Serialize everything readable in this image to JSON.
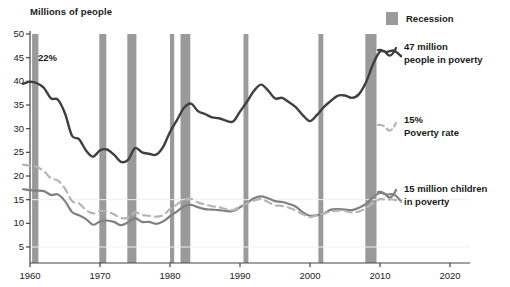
{
  "chart_data": {
    "type": "line",
    "title": "",
    "ylabel": "Millions of people",
    "xlabel": "",
    "ylim": [
      0,
      50
    ],
    "xlim": [
      1959,
      2020
    ],
    "grid": true,
    "gridlines": [
      5,
      15
    ],
    "yticks": [
      5,
      10,
      15,
      20,
      25,
      30,
      35,
      40,
      45,
      50
    ],
    "ytick_labels": [
      "5",
      "10",
      "15",
      "20",
      "25",
      "30",
      "35",
      "40",
      "45",
      "50"
    ],
    "xticks": [
      1960,
      1970,
      1980,
      1990,
      2000,
      2010,
      2020
    ],
    "xtick_labels": [
      "1960",
      "1970",
      "1980",
      "1990",
      "2000",
      "2010",
      "2020"
    ],
    "legend_position": "right",
    "series": [
      {
        "name": "People in poverty",
        "style": "solid",
        "color": "#3f3f3f",
        "unit": "millions",
        "x": [
          1959,
          1960,
          1961,
          1962,
          1963,
          1964,
          1965,
          1966,
          1967,
          1968,
          1969,
          1970,
          1971,
          1972,
          1973,
          1974,
          1975,
          1976,
          1977,
          1978,
          1979,
          1980,
          1981,
          1982,
          1983,
          1984,
          1985,
          1986,
          1987,
          1988,
          1989,
          1990,
          1991,
          1992,
          1993,
          1994,
          1995,
          1996,
          1997,
          1998,
          1999,
          2000,
          2001,
          2002,
          2003,
          2004,
          2005,
          2006,
          2007,
          2008,
          2009,
          2010,
          2011,
          2012,
          2013
        ],
        "values": [
          39.5,
          39.9,
          39.6,
          38.6,
          36.4,
          36.1,
          33.2,
          28.5,
          27.8,
          25.4,
          24.1,
          25.4,
          25.6,
          24.5,
          23.0,
          23.4,
          25.9,
          25.0,
          24.7,
          24.5,
          26.1,
          29.3,
          31.8,
          34.4,
          35.3,
          33.7,
          33.1,
          32.4,
          32.2,
          31.7,
          31.5,
          33.6,
          35.7,
          38.0,
          39.3,
          38.1,
          36.4,
          36.5,
          35.6,
          34.5,
          32.8,
          31.6,
          32.9,
          34.6,
          35.9,
          37.0,
          37.0,
          36.5,
          37.3,
          39.8,
          43.6,
          46.3,
          46.2,
          46.5,
          45.3
        ]
      },
      {
        "name": "Poverty rate",
        "style": "dashed",
        "color": "#b5b5b5",
        "unit": "percent",
        "x": [
          1959,
          1960,
          1961,
          1962,
          1963,
          1964,
          1965,
          1966,
          1967,
          1968,
          1969,
          1970,
          1971,
          1972,
          1973,
          1974,
          1975,
          1976,
          1977,
          1978,
          1979,
          1980,
          1981,
          1982,
          1983,
          1984,
          1985,
          1986,
          1987,
          1988,
          1989,
          1990,
          1991,
          1992,
          1993,
          1994,
          1995,
          1996,
          1997,
          1998,
          1999,
          2000,
          2001,
          2002,
          2003,
          2004,
          2005,
          2006,
          2007,
          2008,
          2009,
          2010,
          2011,
          2012,
          2013
        ],
        "values": [
          22.4,
          22.2,
          21.9,
          21.0,
          19.5,
          19.0,
          17.3,
          14.7,
          14.2,
          12.8,
          12.1,
          12.6,
          12.5,
          11.9,
          11.1,
          11.2,
          12.3,
          11.8,
          11.6,
          11.4,
          11.7,
          13.0,
          14.0,
          15.0,
          15.2,
          14.4,
          14.0,
          13.6,
          13.4,
          13.0,
          12.8,
          13.5,
          14.2,
          14.8,
          15.1,
          14.5,
          13.8,
          13.7,
          13.3,
          12.7,
          11.9,
          11.3,
          11.7,
          12.1,
          12.5,
          12.7,
          12.6,
          12.3,
          12.5,
          13.2,
          14.3,
          15.1,
          15.0,
          15.0,
          14.5
        ]
      },
      {
        "name": "Children in poverty",
        "style": "solid",
        "color": "#808080",
        "unit": "millions",
        "x": [
          1959,
          1960,
          1961,
          1962,
          1963,
          1964,
          1965,
          1966,
          1967,
          1968,
          1969,
          1970,
          1971,
          1972,
          1973,
          1974,
          1975,
          1976,
          1977,
          1978,
          1979,
          1980,
          1981,
          1982,
          1983,
          1984,
          1985,
          1986,
          1987,
          1988,
          1989,
          1990,
          1991,
          1992,
          1993,
          1994,
          1995,
          1996,
          1997,
          1998,
          1999,
          2000,
          2001,
          2002,
          2003,
          2004,
          2005,
          2006,
          2007,
          2008,
          2009,
          2010,
          2011,
          2012,
          2013
        ],
        "values": [
          17.2,
          17.0,
          16.9,
          16.8,
          16.0,
          16.1,
          14.7,
          12.4,
          11.7,
          10.9,
          9.7,
          10.4,
          10.6,
          10.3,
          9.6,
          10.2,
          11.1,
          10.3,
          10.3,
          9.9,
          10.4,
          11.5,
          12.5,
          13.6,
          13.9,
          13.4,
          13.0,
          12.9,
          12.8,
          12.6,
          12.6,
          13.4,
          14.3,
          15.3,
          15.7,
          15.3,
          14.7,
          14.5,
          14.1,
          13.5,
          12.3,
          11.6,
          11.7,
          12.1,
          12.9,
          13.0,
          12.9,
          12.8,
          13.3,
          14.1,
          15.5,
          16.4,
          16.1,
          16.1,
          14.7
        ]
      }
    ],
    "bands": {
      "name": "Recession",
      "color": "#9a9a9a",
      "periods": [
        [
          1960.3,
          1961.2
        ],
        [
          1969.9,
          1970.9
        ],
        [
          1973.9,
          1975.2
        ],
        [
          1980.0,
          1980.6
        ],
        [
          1981.5,
          1982.9
        ],
        [
          1990.5,
          1991.2
        ],
        [
          2001.2,
          2001.9
        ],
        [
          2007.9,
          2009.5
        ]
      ]
    },
    "annotations": [
      {
        "id": "rate-start",
        "text": "22%",
        "x": 1961.4,
        "y": 45
      },
      {
        "id": "people-callout",
        "text": "47 million\npeople in poverty",
        "x": 2014,
        "y": 46
      },
      {
        "id": "rate-callout",
        "text": "15%\nPoverty rate",
        "x": 2014,
        "y": 28.5
      },
      {
        "id": "children-callout",
        "text": "15 million children\nin poverty",
        "x": 2014,
        "y": 17.5
      }
    ]
  },
  "legend": {
    "recession_label": "Recession",
    "recession_color": "#9a9a9a"
  },
  "axis": {
    "y_title": "Millions of people"
  },
  "callouts": {
    "rate_start": "22%",
    "people_line1": "47 million",
    "people_line2": "people in poverty",
    "rate_line1": "15%",
    "rate_line2": "Poverty rate",
    "children_line1": "15 million children",
    "children_line2": "in poverty"
  }
}
